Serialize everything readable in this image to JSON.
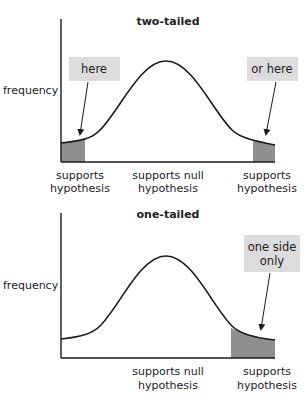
{
  "colors": {
    "curve": "#1a1a1a",
    "axis": "#1a1a1a",
    "shade": "#8f8f8f",
    "callout_fill": "#dcdcdc",
    "background": "#ffffff"
  },
  "charts": [
    {
      "id": "two-tailed",
      "title": "two-tailed",
      "ylabel": "frequency",
      "x_labels": [
        {
          "line1": "supports",
          "line2": "hypothesis"
        },
        {
          "line1": "supports null",
          "line2": "hypothesis"
        },
        {
          "line1": "supports",
          "line2": "hypothesis"
        }
      ],
      "callouts": [
        {
          "text": "here"
        },
        {
          "text": "or here"
        }
      ]
    },
    {
      "id": "one-tailed",
      "title": "one-tailed",
      "ylabel": "frequency",
      "x_labels": [
        {
          "line1": "supports null",
          "line2": "hypothesis"
        },
        {
          "line1": "supports",
          "line2": "hypothesis"
        }
      ],
      "callouts": [
        {
          "line1": "one side",
          "line2": "only"
        }
      ]
    }
  ]
}
